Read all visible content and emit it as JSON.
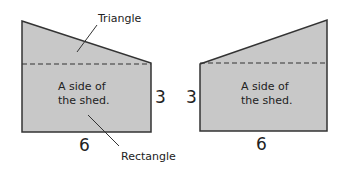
{
  "colors": {
    "fill": "#c8c8c8",
    "stroke": "#333333",
    "background": "#ffffff"
  },
  "left_figure": {
    "triangle_label": "Triangle",
    "rectangle_label": "Rectangle",
    "inner_line1": "A side of",
    "inner_line2": "the shed.",
    "height_label": "3",
    "width_label": "6"
  },
  "right_figure": {
    "inner_line1": "A side of",
    "inner_line2": "the shed.",
    "height_label": "3",
    "width_label": "6"
  }
}
